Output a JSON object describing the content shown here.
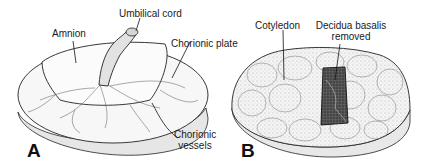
{
  "figure": {
    "panels": [
      {
        "letter": "A",
        "labels": {
          "umbilical_cord": "Umbilical cord",
          "amnion": "Amnion",
          "chorionic_plate": "Chorionic plate",
          "chorionic_vessels_line1": "Chorionic",
          "chorionic_vessels_line2": "vessels"
        }
      },
      {
        "letter": "B",
        "labels": {
          "cotyledon": "Cotyledon",
          "decidua_line1": "Decidua basalis",
          "decidua_line2": "removed"
        }
      }
    ]
  }
}
